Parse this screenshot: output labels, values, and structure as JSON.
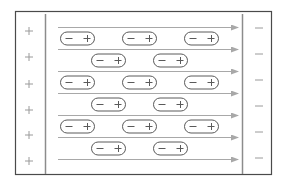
{
  "diagram": {
    "type": "dielectric-polarization",
    "colors": {
      "frame": "#4a4a4a",
      "plate": "#8c8c8c",
      "field_line": "#a8a8a8",
      "arrowhead": "#a8a8a8",
      "dipole_stroke": "#5a5a5a",
      "plate_charge": "#9a9a9a",
      "background": "#ffffff"
    },
    "frame": {
      "x": 15,
      "y": 11,
      "width": 256,
      "height": 163
    },
    "left_plate": {
      "x": 45,
      "charge_symbol": "+",
      "charges_y": [
        31,
        57,
        84,
        110,
        135,
        161
      ],
      "charges_x": 29
    },
    "right_plate": {
      "x": 242,
      "charge_symbol": "−",
      "charges_y": [
        28,
        54,
        80,
        106,
        132,
        158
      ],
      "charges_x": 259
    },
    "field_lines": {
      "x_start": 58,
      "x_end": 238,
      "y": [
        27,
        49,
        71,
        93,
        115,
        137,
        159
      ],
      "direction": "right"
    },
    "dipoles": {
      "negative_symbol": "−",
      "positive_symbol": "+",
      "width": 34,
      "height": 13,
      "rows": [
        {
          "y": 38,
          "x": [
            60,
            122,
            184
          ]
        },
        {
          "y": 60,
          "x": [
            91,
            153
          ]
        },
        {
          "y": 82,
          "x": [
            60,
            122,
            184
          ]
        },
        {
          "y": 104,
          "x": [
            91,
            153
          ]
        },
        {
          "y": 126,
          "x": [
            60,
            122,
            184
          ]
        },
        {
          "y": 148,
          "x": [
            91,
            153
          ]
        }
      ]
    }
  }
}
